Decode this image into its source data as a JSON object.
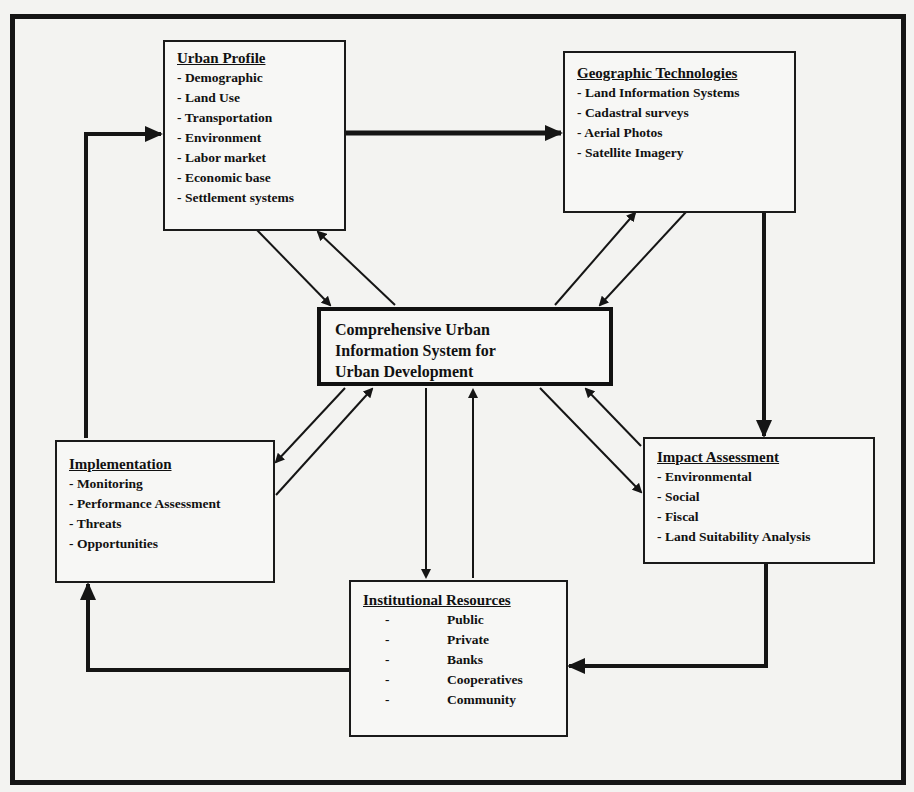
{
  "diagram": {
    "central": {
      "lines": [
        "Comprehensive Urban",
        "Information System for",
        "Urban Development"
      ]
    },
    "boxes": {
      "urban_profile": {
        "title": "Urban Profile",
        "items": [
          "Demographic",
          "Land Use",
          "Transportation",
          "Environment",
          "Labor market",
          "Economic base",
          "Settlement systems"
        ]
      },
      "geographic_technologies": {
        "title": "Geographic Technologies",
        "items": [
          "Land Information Systems",
          "Cadastral surveys",
          "Aerial Photos",
          "Satellite Imagery"
        ]
      },
      "implementation": {
        "title": "Implementation",
        "items": [
          "Monitoring",
          "Performance Assessment",
          "Threats",
          "Opportunities"
        ]
      },
      "impact_assessment": {
        "title": "Impact Assessment",
        "items": [
          "Environmental",
          "Social",
          "Fiscal",
          "Land Suitability Analysis"
        ]
      },
      "institutional_resources": {
        "title": "Institutional Resources",
        "items": [
          "Public",
          "Private",
          "Banks",
          "Cooperatives",
          "Community"
        ]
      }
    },
    "edges": [
      {
        "from": "urban_profile",
        "to": "geographic_technologies",
        "style": "thick"
      },
      {
        "from": "geographic_technologies",
        "to": "impact_assessment",
        "style": "thick"
      },
      {
        "from": "impact_assessment",
        "to": "institutional_resources",
        "style": "thick"
      },
      {
        "from": "institutional_resources",
        "to": "implementation",
        "style": "thick"
      },
      {
        "from": "implementation",
        "to": "urban_profile",
        "style": "thick"
      },
      {
        "from": "central",
        "to": "urban_profile",
        "style": "thin-bidirectional"
      },
      {
        "from": "central",
        "to": "geographic_technologies",
        "style": "thin-bidirectional"
      },
      {
        "from": "central",
        "to": "implementation",
        "style": "thin-bidirectional"
      },
      {
        "from": "central",
        "to": "impact_assessment",
        "style": "thin-bidirectional"
      },
      {
        "from": "central",
        "to": "institutional_resources",
        "style": "thin-bidirectional"
      }
    ],
    "colors": {
      "line": "#151515",
      "background": "#f3f3f1"
    }
  }
}
